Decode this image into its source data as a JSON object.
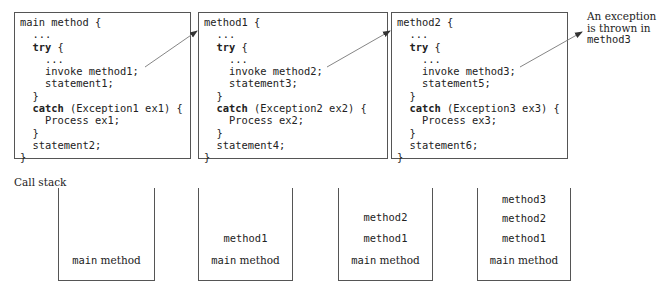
{
  "methods": [
    {
      "header": "main method {",
      "lines": [
        {
          "text": "  ...",
          "bold": false
        },
        {
          "text": "  try {",
          "bold_prefix": "try"
        },
        {
          "text": "    ...",
          "bold": false
        },
        {
          "text": "    invoke method1;",
          "bold": false
        },
        {
          "text": "    statement1;",
          "bold": false
        },
        {
          "text": "  }",
          "bold": false
        },
        {
          "text": "  catch (Exception1 ex1) {",
          "bold_prefix": "catch"
        },
        {
          "text": "    Process ex1;",
          "bold": false
        },
        {
          "text": "  }",
          "bold": false
        },
        {
          "text": "  statement2;",
          "bold": false
        },
        {
          "text": "}",
          "bold": false
        }
      ]
    },
    {
      "header": "method1 {",
      "lines": [
        {
          "text": "  ...",
          "bold": false
        },
        {
          "text": "  try {",
          "bold_prefix": "try"
        },
        {
          "text": "    ...",
          "bold": false
        },
        {
          "text": "    invoke method2;",
          "bold": false
        },
        {
          "text": "    statement3;",
          "bold": false
        },
        {
          "text": "  }",
          "bold": false
        },
        {
          "text": "  catch (Exception2 ex2) {",
          "bold_prefix": "catch"
        },
        {
          "text": "    Process ex2;",
          "bold": false
        },
        {
          "text": "  }",
          "bold": false
        },
        {
          "text": "  statement4;",
          "bold": false
        },
        {
          "text": "}",
          "bold": false
        }
      ]
    },
    {
      "header": "method2 {",
      "lines": [
        {
          "text": "  ...",
          "bold": false
        },
        {
          "text": "  try {",
          "bold_prefix": "try"
        },
        {
          "text": "    ...",
          "bold": false
        },
        {
          "text": "    invoke method3;",
          "bold": false
        },
        {
          "text": "    statement5;",
          "bold": false
        },
        {
          "text": "  }",
          "bold": false
        },
        {
          "text": "  catch (Exception3 ex3) {",
          "bold_prefix": "catch"
        },
        {
          "text": "    Process ex3;",
          "bold": false
        },
        {
          "text": "  }",
          "bold": false
        },
        {
          "text": "  statement6;",
          "bold": false
        },
        {
          "text": "}",
          "bold": false
        }
      ]
    }
  ],
  "annotation": {
    "line1": "An exception",
    "line2": "is thrown in",
    "line3": "method3"
  },
  "call_stack": {
    "label": "Call stack",
    "stacks": [
      {
        "frames": [
          {
            "mono": "main",
            "serif": " method"
          }
        ]
      },
      {
        "frames": [
          {
            "mono": "method1",
            "serif": ""
          },
          {
            "mono": "main",
            "serif": " method"
          }
        ]
      },
      {
        "frames": [
          {
            "mono": "method2",
            "serif": ""
          },
          {
            "mono": "method1",
            "serif": ""
          },
          {
            "mono": "main",
            "serif": " method"
          }
        ]
      },
      {
        "frames": [
          {
            "mono": "method3",
            "serif": ""
          },
          {
            "mono": "method2",
            "serif": ""
          },
          {
            "mono": "method1",
            "serif": ""
          },
          {
            "mono": "main",
            "serif": " method"
          }
        ]
      }
    ]
  },
  "colors": {
    "border": "#555555",
    "text": "#222222",
    "arrow": "#666666"
  }
}
